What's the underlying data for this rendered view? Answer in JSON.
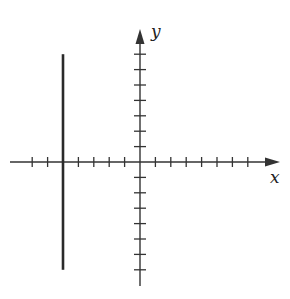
{
  "chart_data": {
    "type": "line",
    "title": "",
    "xlabel": "x",
    "ylabel": "y",
    "xlim": [
      -8,
      8.5
    ],
    "ylim": [
      -8,
      8.5
    ],
    "x_ticks": [
      -7,
      -6,
      -5,
      -4,
      -3,
      -2,
      -1,
      1,
      2,
      3,
      4,
      5,
      6,
      7
    ],
    "y_ticks": [
      -7,
      -6,
      -5,
      -4,
      -3,
      -2,
      -1,
      1,
      2,
      3,
      4,
      5,
      6,
      7
    ],
    "tick_labels_shown": false,
    "grid": false,
    "series": [
      {
        "name": "x = -5",
        "x": [
          -5,
          -5
        ],
        "y": [
          -7,
          7
        ]
      }
    ]
  },
  "axes": {
    "x_label": "x",
    "y_label": "y"
  },
  "colors": {
    "axis": "#333333",
    "line": "#2a2a2a"
  }
}
